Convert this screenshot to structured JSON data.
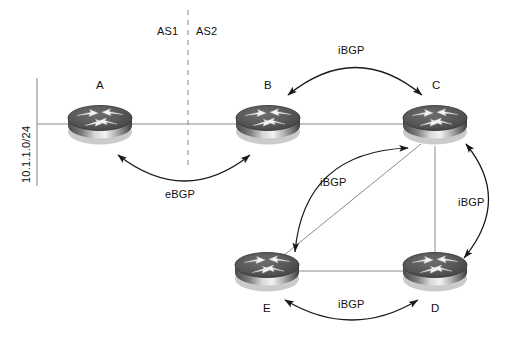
{
  "diagram": {
    "type": "bgp-network-topology",
    "title": "",
    "background_color": "#ffffff",
    "line_color": "#8c8c8c",
    "arrow_color": "#1a1a1a",
    "router_color_top": "#4d4d4d",
    "router_color_body": "#9a9a9a"
  },
  "autonomous_systems": {
    "left_label": "AS1",
    "right_label": "AS2",
    "divider_style": "dashed"
  },
  "prefix": {
    "label": "10.1.1.0/24"
  },
  "routers": [
    {
      "id": "A",
      "label": "A",
      "x": 100,
      "y": 124,
      "label_pos": "above",
      "as": "AS1"
    },
    {
      "id": "B",
      "label": "B",
      "x": 268,
      "y": 124,
      "label_pos": "above",
      "as": "AS2"
    },
    {
      "id": "C",
      "label": "C",
      "x": 435,
      "y": 124,
      "label_pos": "above",
      "as": "AS2"
    },
    {
      "id": "E",
      "label": "E",
      "x": 267,
      "y": 271,
      "label_pos": "below",
      "as": "AS2"
    },
    {
      "id": "D",
      "label": "D",
      "x": 435,
      "y": 271,
      "label_pos": "below",
      "as": "AS2"
    }
  ],
  "physical_links": [
    {
      "from": "prefix-bar",
      "to": "A"
    },
    {
      "from": "A",
      "to": "B"
    },
    {
      "from": "B",
      "to": "C"
    },
    {
      "from": "C",
      "to": "E"
    },
    {
      "from": "C",
      "to": "D"
    },
    {
      "from": "E",
      "to": "D"
    }
  ],
  "sessions": [
    {
      "from": "A",
      "to": "B",
      "label": "eBGP",
      "type": "eBGP"
    },
    {
      "from": "B",
      "to": "C",
      "label": "iBGP",
      "type": "iBGP"
    },
    {
      "from": "C",
      "to": "E",
      "label": "iBGP",
      "type": "iBGP"
    },
    {
      "from": "C",
      "to": "D",
      "label": "iBGP",
      "type": "iBGP"
    },
    {
      "from": "E",
      "to": "D",
      "label": "iBGP",
      "type": "iBGP"
    }
  ],
  "labels": {
    "ebgp_ab": "eBGP",
    "ibgp_bc": "iBGP",
    "ibgp_ce": "iBGP",
    "ibgp_cd": "iBGP",
    "ibgp_ed": "iBGP"
  }
}
